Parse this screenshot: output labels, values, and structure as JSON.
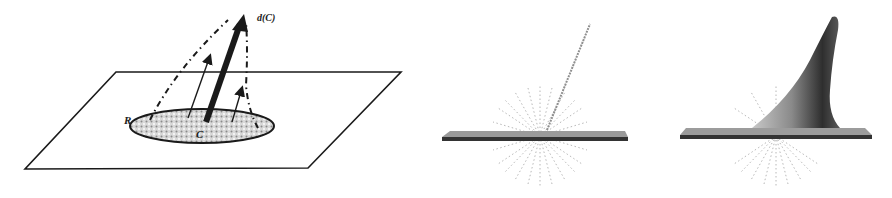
{
  "figure": {
    "panels": [
      {
        "id": "a",
        "description": "Schematic: plane with shaded elliptical region R around point C; vectors rising from region with dash-dot envelope; thick arrow labeled d(C)",
        "labels": {
          "region": "R",
          "center": "C",
          "vector": "d(C)"
        }
      },
      {
        "id": "b",
        "description": "3D rendering: flat plate with radial dotted field and a thin thread-like line rising diagonally"
      },
      {
        "id": "c",
        "description": "3D rendering: flat plate deformed into a tall curved shaded spike with radial dotted field"
      }
    ],
    "colors": {
      "ink": "#1a1a1a",
      "region_fill": "#bdbdbd",
      "plate_top": "#9a9a9a",
      "plate_edge": "#3a3a3a",
      "dots": "#b0b0b0"
    }
  }
}
